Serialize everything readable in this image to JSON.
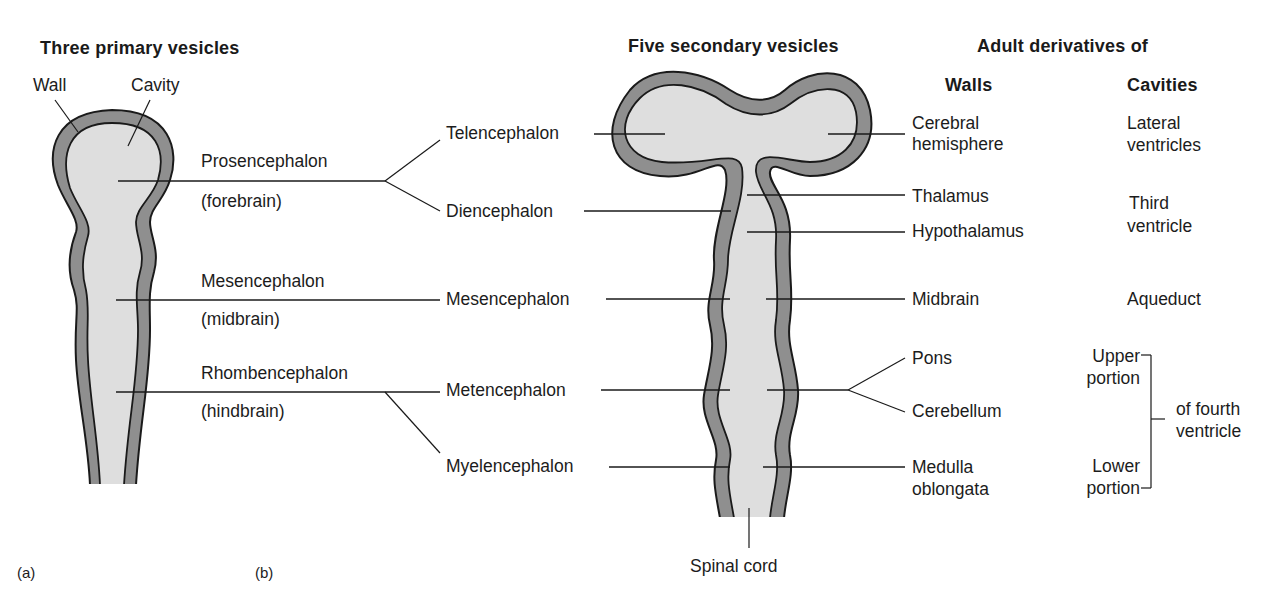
{
  "panel_a": {
    "title": "Three primary vesicles",
    "wall_label": "Wall",
    "cavity_label": "Cavity",
    "vesicles": [
      {
        "name": "Prosencephalon",
        "common": "(forebrain)"
      },
      {
        "name": "Mesencephalon",
        "common": "(midbrain)"
      },
      {
        "name": "Rhombencephalon",
        "common": "(hindbrain)"
      }
    ],
    "panel_label": "(a)"
  },
  "panel_b": {
    "title": "Five secondary vesicles",
    "vesicles": [
      "Telencephalon",
      "Diencephalon",
      "Mesencephalon",
      "Metencephalon",
      "Myelencephalon"
    ],
    "spinal_cord_label": "Spinal cord",
    "panel_label": "(b)"
  },
  "derivatives": {
    "title": "Adult derivatives of",
    "walls_header": "Walls",
    "cavities_header": "Cavities",
    "walls": {
      "cerebral_1": "Cerebral",
      "cerebral_2": "hemisphere",
      "thalamus": "Thalamus",
      "hypothalamus": "Hypothalamus",
      "midbrain": "Midbrain",
      "pons": "Pons",
      "cerebellum": "Cerebellum",
      "medulla_1": "Medulla",
      "medulla_2": "oblongata"
    },
    "cavities": {
      "lateral_1": "Lateral",
      "lateral_2": "ventricles",
      "third_1": "Third",
      "third_2": "ventricle",
      "aqueduct": "Aqueduct",
      "upper_1": "Upper",
      "upper_2": "portion",
      "lower_1": "Lower",
      "lower_2": "portion",
      "fourth_1": "of fourth",
      "fourth_2": "ventricle"
    }
  },
  "colors": {
    "wall_fill": "#8f8f8f",
    "cavity_fill": "#dedede",
    "outline": "#1a1a1a",
    "background": "#ffffff"
  }
}
